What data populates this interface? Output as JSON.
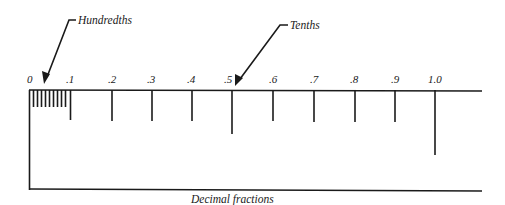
{
  "diagram": {
    "title": "Decimal fractions",
    "callouts": {
      "hundredths": "Hundredths",
      "tenths": "Tenths"
    },
    "tick_labels": [
      "0",
      ".1",
      ".2",
      ".3",
      ".4",
      ".5",
      ".6",
      ".7",
      ".8",
      ".9",
      "1.0"
    ],
    "colors": {
      "ink": "#1a1a1a",
      "background": "#ffffff"
    }
  }
}
